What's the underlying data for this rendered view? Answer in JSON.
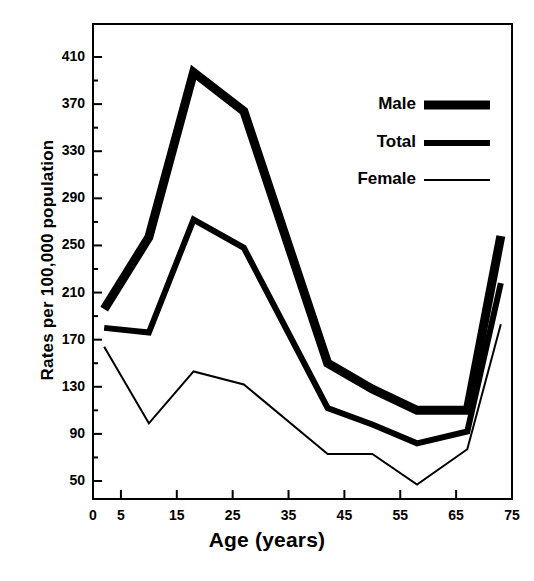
{
  "chart_data": {
    "type": "line",
    "title": "",
    "xlabel": "Age (years)",
    "ylabel": "Rates per 100,000 population",
    "xlim": [
      0,
      75
    ],
    "ylim": [
      30,
      430
    ],
    "grid": false,
    "legend_position": "top-right",
    "xticks": [
      {
        "value": 0,
        "label": "0"
      },
      {
        "value": 5,
        "label": "5"
      },
      {
        "value": 15,
        "label": "15"
      },
      {
        "value": 25,
        "label": "25"
      },
      {
        "value": 35,
        "label": "35"
      },
      {
        "value": 45,
        "label": "45"
      },
      {
        "value": 55,
        "label": "55"
      },
      {
        "value": 65,
        "label": "65"
      },
      {
        "value": 75,
        "label": "75"
      }
    ],
    "yticks": [
      {
        "value": 410,
        "label": "410"
      },
      {
        "value": 370,
        "label": "370"
      },
      {
        "value": 330,
        "label": "330"
      },
      {
        "value": 290,
        "label": "290"
      },
      {
        "value": 250,
        "label": "250"
      },
      {
        "value": 210,
        "label": "210"
      },
      {
        "value": 170,
        "label": "170"
      },
      {
        "value": 130,
        "label": "130"
      },
      {
        "value": 90,
        "label": "90"
      },
      {
        "value": 50,
        "label": "50"
      }
    ],
    "yminorticks": [
      390,
      350,
      310,
      270,
      230,
      190,
      150,
      110,
      70
    ],
    "x": [
      2,
      10,
      18,
      27,
      42,
      50,
      58,
      67,
      73
    ],
    "series": [
      {
        "name": "Male",
        "color": "#000000",
        "width": 9,
        "values": [
          196,
          257,
          397,
          364,
          150,
          128,
          110,
          110,
          258
        ]
      },
      {
        "name": "Total",
        "color": "#000000",
        "width": 6,
        "values": [
          180,
          176,
          272,
          248,
          112,
          98,
          82,
          92,
          218
        ]
      },
      {
        "name": "Female",
        "color": "#000000",
        "width": 2,
        "values": [
          164,
          99,
          143,
          132,
          73,
          73,
          47,
          77,
          183
        ]
      }
    ]
  },
  "legend": {
    "items": [
      {
        "label": "Male",
        "swatch_width": 9
      },
      {
        "label": "Total",
        "swatch_width": 6
      },
      {
        "label": "Female",
        "swatch_width": 2
      }
    ]
  }
}
